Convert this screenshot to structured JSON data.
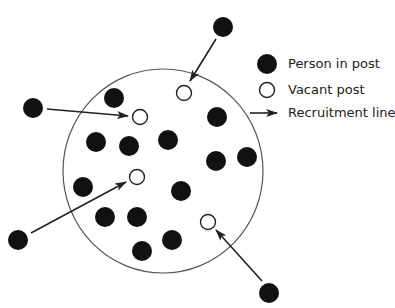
{
  "diagram": {
    "boundary": {
      "cx": 163,
      "cy": 171,
      "rx": 100,
      "ry": 102,
      "stroke": "#555555"
    },
    "colors": {
      "filled": "#111111",
      "stroke": "#222222",
      "background": "#ffffff"
    },
    "people_in_post": [
      {
        "x": 114,
        "y": 98
      },
      {
        "x": 217,
        "y": 117
      },
      {
        "x": 96,
        "y": 142
      },
      {
        "x": 129,
        "y": 146
      },
      {
        "x": 168,
        "y": 140
      },
      {
        "x": 216,
        "y": 161
      },
      {
        "x": 247,
        "y": 157
      },
      {
        "x": 83,
        "y": 187
      },
      {
        "x": 181,
        "y": 191
      },
      {
        "x": 105,
        "y": 217
      },
      {
        "x": 137,
        "y": 217
      },
      {
        "x": 172,
        "y": 240
      },
      {
        "x": 142,
        "y": 251
      }
    ],
    "vacant_posts": [
      {
        "x": 184,
        "y": 93
      },
      {
        "x": 140,
        "y": 117
      },
      {
        "x": 137,
        "y": 177
      },
      {
        "x": 208,
        "y": 222
      }
    ],
    "external_candidates": [
      {
        "x": 223,
        "y": 27
      },
      {
        "x": 33,
        "y": 108
      },
      {
        "x": 18,
        "y": 240
      },
      {
        "x": 269,
        "y": 293
      }
    ],
    "recruitment_lines": [
      {
        "x1": 216,
        "y1": 39,
        "x2": 190,
        "y2": 81
      },
      {
        "x1": 47,
        "y1": 109,
        "x2": 128,
        "y2": 116
      },
      {
        "x1": 31,
        "y1": 233,
        "x2": 126,
        "y2": 182
      },
      {
        "x1": 262,
        "y1": 281,
        "x2": 216,
        "y2": 230
      }
    ]
  },
  "legend": {
    "items": [
      {
        "symbol": "filled-circle",
        "label": "Person in post"
      },
      {
        "symbol": "open-circle",
        "label": "Vacant post"
      },
      {
        "symbol": "arrow",
        "label": "Recruitment line"
      }
    ]
  }
}
